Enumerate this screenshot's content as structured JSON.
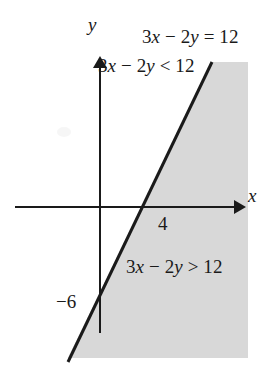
{
  "figure": {
    "background_color": "#ffffff",
    "line_color": "#1a1a1a",
    "axis_color": "#1a1a1a",
    "shade_color": "#d8d8d8"
  },
  "axes": {
    "x_label": "x",
    "y_label": "y",
    "x_arrow": "arrow-right",
    "y_arrow": "arrow-up"
  },
  "labels": {
    "line_equation": "3x − 2y = 12",
    "region_less": "3x − 2y < 12",
    "region_greater": "3x − 2y > 12",
    "x_intercept_tick": "4",
    "y_intercept_tick": "−6"
  },
  "chart_data": {
    "type": "line",
    "title": "3x − 2y = 12",
    "xlabel": "x",
    "ylabel": "y",
    "grid": false,
    "legend": "none",
    "boundary_line": {
      "equation": "3x - 2y = 12",
      "slope": 1.5,
      "y_intercept": -6,
      "x_intercept": 4,
      "style": "solid",
      "points": [
        {
          "x": 4,
          "y": 0
        },
        {
          "x": 0,
          "y": -6
        }
      ]
    },
    "shaded_region": {
      "inequality": "3x - 2y > 12",
      "side": "right-below",
      "fill": "#d8d8d8"
    },
    "unshaded_region": {
      "inequality": "3x - 2y < 12",
      "side": "left-above"
    },
    "annotations": [
      {
        "text": "3x − 2y = 12",
        "position": "upper-right"
      },
      {
        "text": "3x − 2y < 12",
        "position": "upper-left-of-line"
      },
      {
        "text": "3x − 2y > 12",
        "position": "lower-right-in-shading"
      },
      {
        "text": "4",
        "position": "below-x-intercept"
      },
      {
        "text": "−6",
        "position": "left-of-y-intercept"
      }
    ]
  }
}
